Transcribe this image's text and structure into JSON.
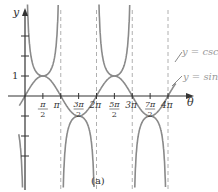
{
  "chart_data": {
    "type": "line",
    "title": "",
    "caption": "(a)",
    "xlabel": "θ",
    "ylabel": "y",
    "x_ticks": [
      {
        "value": 1.5708,
        "label_num": "π",
        "label_den": "2"
      },
      {
        "value": 3.1416,
        "label": "π"
      },
      {
        "value": 4.7124,
        "label_num": "3π",
        "label_den": "2"
      },
      {
        "value": 6.2832,
        "label": "2π"
      },
      {
        "value": 7.854,
        "label_num": "5π",
        "label_den": "2"
      },
      {
        "value": 9.4248,
        "label": "3π"
      },
      {
        "value": 10.9956,
        "label_num": "7π",
        "label_den": "2"
      },
      {
        "value": 12.5664,
        "label": "4π"
      }
    ],
    "y_ticks": [
      -3,
      -2,
      -1,
      1,
      2,
      3
    ],
    "y_tick_labels": [
      {
        "value": 1,
        "label": "1"
      }
    ],
    "xlim": [
      -0.6,
      14.5
    ],
    "ylim": [
      -4.8,
      4.8
    ],
    "asymptotes": [
      3.1416,
      6.2832,
      9.4248,
      12.5664
    ],
    "series": [
      {
        "name": "y = csc θ",
        "function": "csc",
        "color": "#8a8a8a"
      },
      {
        "name": "y = sin θ",
        "function": "sin",
        "color": "#8a8a8a"
      }
    ],
    "legend": [
      {
        "label": "y = csc θ"
      },
      {
        "label": "y = sin θ"
      }
    ],
    "grid": false
  },
  "colors": {
    "axis": "#333333",
    "curve": "#8a8a8a",
    "asymptote": "#b0b0b0",
    "label_light": "#9a9a9a"
  }
}
